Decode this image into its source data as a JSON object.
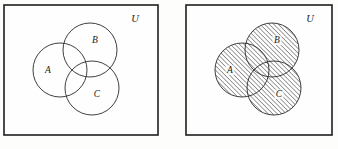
{
  "figure": {
    "background_color": "#fdfdfc",
    "ink_color": "#1f1f1f",
    "hatch_color": "#555555"
  },
  "panels": [
    {
      "id": "left-panel",
      "name": "unshaded-venn-panel",
      "frame": {
        "x": 4,
        "y": 5,
        "width": 154,
        "height": 130
      },
      "shaded": false,
      "universe_label": "U",
      "universe_label_pos": {
        "x": 135,
        "y": 22
      },
      "circles": [
        {
          "label": "A",
          "cx": 60,
          "cy": 70,
          "r": 27,
          "label_x": 48,
          "label_y": 73
        },
        {
          "label": "B",
          "cx": 90,
          "cy": 50,
          "r": 27,
          "label_x": 95,
          "label_y": 43
        },
        {
          "label": "C",
          "cx": 92,
          "cy": 88,
          "r": 27,
          "label_x": 97,
          "label_y": 97
        }
      ]
    },
    {
      "id": "right-panel",
      "name": "shaded-venn-panel",
      "frame": {
        "x": 186,
        "y": 5,
        "width": 146,
        "height": 130
      },
      "shaded": true,
      "shaded_region": "A union B union C",
      "universe_label": "U",
      "universe_label_pos": {
        "x": 310,
        "y": 22
      },
      "circles": [
        {
          "label": "A",
          "cx": 242,
          "cy": 70,
          "r": 27,
          "label_x": 230,
          "label_y": 73
        },
        {
          "label": "B",
          "cx": 272,
          "cy": 50,
          "r": 27,
          "label_x": 277,
          "label_y": 43
        },
        {
          "label": "C",
          "cx": 274,
          "cy": 88,
          "r": 27,
          "label_x": 279,
          "label_y": 97
        }
      ]
    }
  ],
  "chart_data": {
    "type": "diagram",
    "diagram_kind": "venn",
    "set_count": 3,
    "sets": [
      "A",
      "B",
      "C"
    ],
    "universe": "U",
    "panel_count": 2,
    "panels": [
      {
        "index": 0,
        "shading": "none",
        "description": "Three overlapping circles A, B, C inside rectangle U, outlines only"
      },
      {
        "index": 1,
        "shading": "A union B union C",
        "description": "Same three circles with the entire union region filled with 45-degree diagonal hatching"
      }
    ]
  }
}
